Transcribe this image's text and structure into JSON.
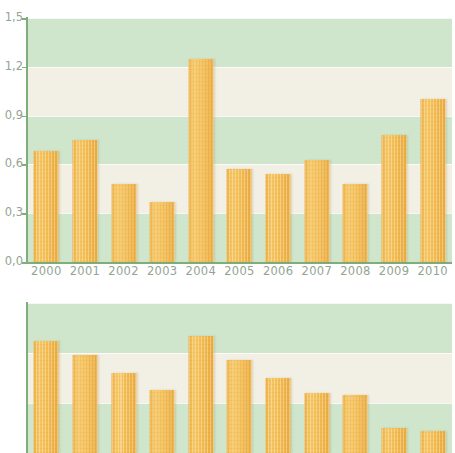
{
  "figure": {
    "background": "#ffffff",
    "bar_color": "#f3bd53",
    "band_green": "#cfe6cd",
    "band_cream": "#f2efe4",
    "axis_color": "#7fae7a",
    "label_color": "#93a493"
  },
  "chart_data": [
    {
      "id": "top",
      "type": "bar",
      "title": "",
      "xlabel": "",
      "ylabel": "",
      "categories": [
        "2000",
        "2001",
        "2002",
        "2003",
        "2004",
        "2005",
        "2006",
        "2007",
        "2008",
        "2009",
        "2010"
      ],
      "values": [
        0.68,
        0.75,
        0.48,
        0.37,
        1.25,
        0.57,
        0.54,
        0.63,
        0.48,
        0.78,
        1.0
      ],
      "ylim": [
        0.0,
        1.5
      ],
      "yticks": [
        0.0,
        0.3,
        0.6,
        0.9,
        1.2,
        1.5
      ],
      "ytick_labels": [
        "0,0",
        "0,3",
        "0,6",
        "0,9",
        "1,2",
        "1,5"
      ],
      "grid": true,
      "legend": "none",
      "bands": [
        "green",
        "cream",
        "green",
        "cream",
        "green"
      ]
    },
    {
      "id": "bottom",
      "type": "bar",
      "title": "",
      "xlabel": "",
      "ylabel": "",
      "categories": [
        "2000",
        "2001",
        "2002",
        "2003",
        "2004",
        "2005",
        "2006",
        "2007",
        "2008",
        "2009",
        "2010"
      ],
      "values": [
        127,
        119,
        108,
        98,
        130,
        116,
        105,
        96,
        95,
        75,
        73
      ],
      "ylim": [
        60,
        150
      ],
      "yticks": [
        60,
        90,
        120,
        150
      ],
      "ytick_labels": [
        "60",
        "90",
        "120",
        "150"
      ],
      "grid": true,
      "legend": "none",
      "bands": [
        "green",
        "cream",
        "green"
      ],
      "clipped_bottom": true
    }
  ]
}
